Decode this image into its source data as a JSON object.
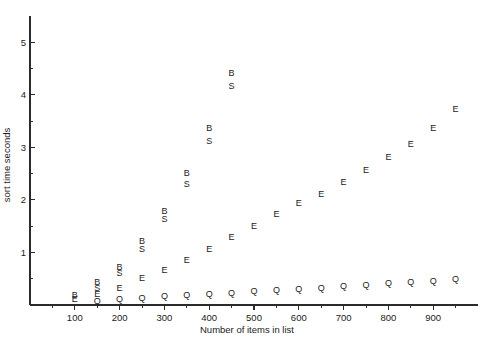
{
  "chart_data": {
    "type": "scatter",
    "title": "",
    "xlabel": "Number of items in list",
    "ylabel": "sort time seconds",
    "xlim": [
      0,
      1000
    ],
    "ylim": [
      0,
      5.5
    ],
    "xticks": [
      100,
      200,
      300,
      400,
      500,
      600,
      700,
      800,
      900
    ],
    "xminor_step": 50,
    "yticks": [
      1,
      2,
      3,
      4,
      5
    ],
    "yminor_step": 0.5,
    "grid": false,
    "legend": "none",
    "marker_style": "letter-glyph",
    "series": [
      {
        "name": "B",
        "glyph": "B",
        "x": [
          100,
          150,
          200,
          250,
          300,
          350,
          400,
          450
        ],
        "y": [
          0.18,
          0.42,
          0.72,
          1.2,
          1.78,
          2.5,
          3.35,
          4.4
        ]
      },
      {
        "name": "S",
        "glyph": "S",
        "x": [
          150,
          200,
          250,
          300,
          350,
          400,
          450
        ],
        "y": [
          0.32,
          0.6,
          1.05,
          1.62,
          2.3,
          3.1,
          4.15
        ]
      },
      {
        "name": "E",
        "glyph": "E",
        "x": [
          100,
          150,
          200,
          250,
          300,
          350,
          400,
          450,
          500,
          550,
          600,
          650,
          700,
          750,
          800,
          850,
          900,
          950
        ],
        "y": [
          0.1,
          0.2,
          0.32,
          0.5,
          0.66,
          0.85,
          1.05,
          1.28,
          1.5,
          1.72,
          1.92,
          2.1,
          2.32,
          2.55,
          2.8,
          3.05,
          3.35,
          3.72
        ]
      },
      {
        "name": "Q",
        "glyph": "Q",
        "x": [
          150,
          200,
          250,
          300,
          350,
          400,
          450,
          500,
          550,
          600,
          650,
          700,
          750,
          800,
          850,
          900,
          950
        ],
        "y": [
          0.07,
          0.1,
          0.12,
          0.15,
          0.17,
          0.2,
          0.22,
          0.25,
          0.27,
          0.3,
          0.32,
          0.35,
          0.37,
          0.4,
          0.42,
          0.45,
          0.48
        ]
      }
    ]
  },
  "axes": {
    "x_title": "Number of items in list",
    "y_title": "sort time seconds"
  }
}
